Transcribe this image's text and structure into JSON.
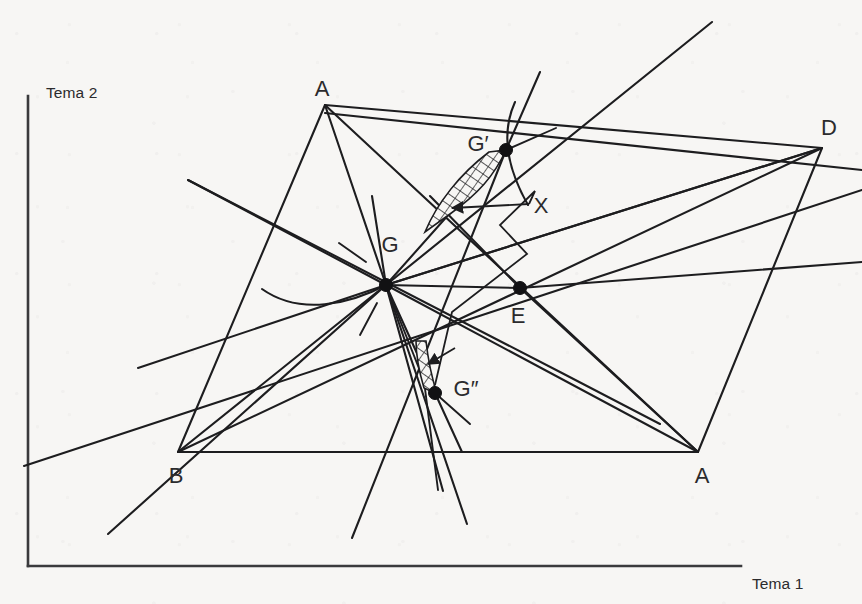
{
  "figure": {
    "background_color": "#f7f6f4",
    "ink_color": "#1d1d1f",
    "axes": {
      "y_label": "Tema 2",
      "x_label": "Tema 1",
      "origin": [
        28,
        566
      ],
      "y_top": [
        28,
        96
      ],
      "x_right": [
        741,
        566
      ]
    },
    "vertices": [
      {
        "id": "A-top",
        "label": "A",
        "x": 325,
        "y": 105,
        "label_x": 322,
        "label_y": 90,
        "dot": false
      },
      {
        "id": "D-right",
        "label": "D",
        "x": 822,
        "y": 148,
        "label_x": 829,
        "label_y": 129,
        "dot": false
      },
      {
        "id": "B-left",
        "label": "B",
        "x": 178,
        "y": 452,
        "label_x": 176,
        "label_y": 477,
        "dot": false
      },
      {
        "id": "A-bottom",
        "label": "A",
        "x": 698,
        "y": 452,
        "label_x": 702,
        "label_y": 477,
        "dot": false
      },
      {
        "id": "G",
        "label": "G",
        "x": 386,
        "y": 285,
        "label_x": 390,
        "label_y": 246,
        "dot": true
      },
      {
        "id": "G-prime",
        "label": "G′",
        "x": 506,
        "y": 150,
        "label_x": 478,
        "label_y": 145,
        "dot": true
      },
      {
        "id": "G-dprime",
        "label": "G″",
        "x": 435,
        "y": 393,
        "label_x": 462,
        "label_y": 390,
        "dot": true
      },
      {
        "id": "E",
        "label": "E",
        "x": 520,
        "y": 288,
        "label_x": 518,
        "label_y": 317,
        "dot": true
      }
    ],
    "annotations": [
      {
        "id": "X",
        "label": "X",
        "label_x": 541,
        "label_y": 207
      }
    ],
    "hatched_regions": [
      {
        "id": "upper-lune",
        "description": "cross-hatched lune between G-prime and arrow target"
      },
      {
        "id": "lower-lune",
        "description": "cross-hatched lune between G and G-double-prime"
      }
    ],
    "quadrilateral": {
      "name": "ABDA",
      "path": "A-top -> D-right -> A-bottom -> B-left -> A-top"
    }
  }
}
